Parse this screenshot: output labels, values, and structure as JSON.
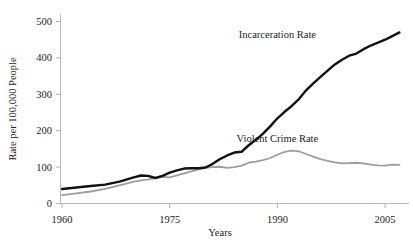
{
  "chart_data": {
    "type": "line",
    "title": "",
    "xlabel": "Years",
    "ylabel": "Rate per 100,000 People",
    "xlim": [
      1960,
      2008
    ],
    "ylim": [
      0,
      530
    ],
    "xticks": [
      1960,
      1975,
      1990,
      2005
    ],
    "xtick_labels": [
      "1960",
      "1975",
      "1990",
      "2005"
    ],
    "yticks": [
      0,
      100,
      200,
      300,
      400,
      500
    ],
    "ytick_labels": [
      "0",
      "100",
      "200",
      "300",
      "400",
      "500"
    ],
    "grid": false,
    "legend_position": "inline-annotation",
    "series": [
      {
        "name": "Incarceration Rate",
        "color": "#111111",
        "line_width": 2.4,
        "label_x": 1990,
        "label_y": 455,
        "x": [
          1960,
          1962,
          1964,
          1966,
          1968,
          1970,
          1971,
          1972,
          1973,
          1974,
          1975,
          1976,
          1977,
          1978,
          1979,
          1980,
          1981,
          1982,
          1983,
          1984,
          1985,
          1986,
          1987,
          1988,
          1989,
          1990,
          1991,
          1992,
          1993,
          1994,
          1995,
          1996,
          1997,
          1998,
          1999,
          2000,
          2001,
          2002,
          2003,
          2004,
          2005,
          2006,
          2007
        ],
        "values": [
          40,
          44,
          48,
          52,
          60,
          72,
          77,
          76,
          70,
          76,
          85,
          91,
          96,
          97,
          97,
          99,
          109,
          122,
          132,
          140,
          142,
          160,
          175,
          192,
          212,
          234,
          252,
          268,
          287,
          311,
          330,
          348,
          365,
          382,
          395,
          406,
          412,
          424,
          434,
          442,
          450,
          460,
          470
        ]
      },
      {
        "name": "Violent Crime Rate",
        "color": "#9d9d9d",
        "line_width": 1.8,
        "label_x": 1990,
        "label_y": 170,
        "x": [
          1960,
          1962,
          1964,
          1966,
          1968,
          1970,
          1972,
          1974,
          1975,
          1976,
          1977,
          1978,
          1979,
          1980,
          1981,
          1982,
          1983,
          1984,
          1985,
          1986,
          1987,
          1988,
          1989,
          1990,
          1991,
          1992,
          1993,
          1994,
          1995,
          1996,
          1997,
          1998,
          1999,
          2000,
          2001,
          2002,
          2003,
          2004,
          2005,
          2006,
          2007
        ],
        "values": [
          23,
          28,
          33,
          40,
          50,
          60,
          66,
          73,
          72,
          77,
          83,
          88,
          94,
          98,
          100,
          101,
          98,
          100,
          104,
          112,
          115,
          119,
          125,
          134,
          142,
          145,
          143,
          136,
          129,
          122,
          117,
          113,
          110,
          111,
          112,
          110,
          107,
          105,
          104,
          107,
          106
        ]
      }
    ]
  }
}
